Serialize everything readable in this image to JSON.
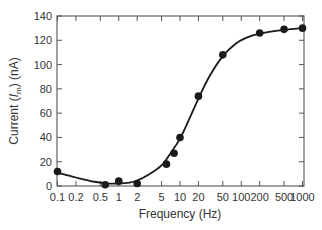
{
  "chart_data": {
    "type": "scatter",
    "title": "",
    "xlabel": "Frequency (Hz)",
    "ylabel": "Current (I_m) (nA)",
    "ylabel_parts": {
      "prefix": "Current (",
      "var": "I",
      "sub": "m",
      "suffix": ") (nA)"
    },
    "xscale": "log",
    "xlim": [
      0.1,
      1000
    ],
    "ylim": [
      0,
      140
    ],
    "grid": false,
    "legend": null,
    "x_ticks": [
      0.1,
      0.2,
      0.5,
      1,
      2,
      5,
      10,
      20,
      50,
      100,
      200,
      500,
      1000
    ],
    "x_tick_labels": [
      "0.1",
      "0.2",
      "0.5",
      "1",
      "2",
      "5",
      "10",
      "20",
      "50",
      "100",
      "200",
      "500",
      "1000"
    ],
    "y_ticks": [
      0,
      20,
      40,
      60,
      80,
      100,
      120,
      140
    ],
    "y_tick_labels": [
      "0",
      "20",
      "40",
      "60",
      "80",
      "100",
      "120",
      "140"
    ],
    "series": [
      {
        "name": "measured",
        "style": "markers",
        "x": [
          0.1,
          0.6,
          1,
          2,
          6,
          8,
          10,
          20,
          50,
          200,
          500,
          1000
        ],
        "y": [
          12,
          1,
          4,
          2,
          18,
          27,
          40,
          74,
          108,
          126,
          129,
          130
        ]
      },
      {
        "name": "fit",
        "style": "smooth-line",
        "x": [
          0.1,
          0.2,
          0.4,
          0.7,
          1,
          1.5,
          2,
          3,
          5,
          7,
          10,
          15,
          20,
          30,
          50,
          80,
          120,
          200,
          500,
          1000
        ],
        "y": [
          11,
          7,
          3.5,
          2,
          2,
          2.8,
          4.5,
          9,
          17,
          27,
          39,
          58,
          72,
          90,
          107,
          117,
          122,
          125.5,
          128.5,
          130
        ]
      }
    ],
    "colors": {
      "line": "#1a1a1a",
      "marker": "#1a1a1a",
      "axis": "#555555"
    }
  }
}
